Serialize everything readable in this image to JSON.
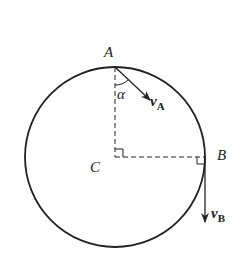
{
  "diagram": {
    "type": "circular-motion",
    "colors": {
      "stroke": "#222222",
      "background": "#ffffff"
    },
    "circle": {
      "cx": 115,
      "cy": 157,
      "r": 90
    },
    "points": {
      "A": {
        "label": "A",
        "x": 115,
        "y": 67
      },
      "B": {
        "label": "B",
        "x": 205,
        "y": 157
      },
      "C": {
        "label": "C",
        "x": 115,
        "y": 157
      }
    },
    "vectors": {
      "vA": {
        "symbol": "v",
        "subscript": "A"
      },
      "vB": {
        "symbol": "v",
        "subscript": "B"
      }
    },
    "angle": {
      "label": "α"
    }
  }
}
